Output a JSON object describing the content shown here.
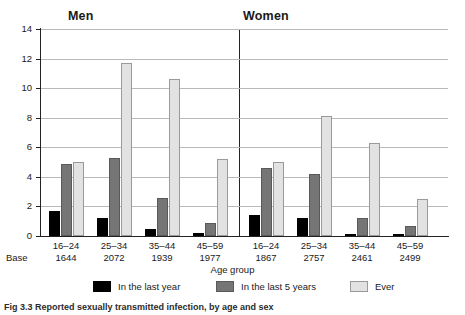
{
  "figure": {
    "caption": "Fig 3.3  Reported sexually transmitted infection, by age and sex"
  },
  "panels": [
    {
      "title": "Men"
    },
    {
      "title": "Women"
    }
  ],
  "axes": {
    "ylabel": "Percentage",
    "xlabel": "Age group",
    "base_word": "Base",
    "yticks": [
      "0",
      "2",
      "4",
      "6",
      "8",
      "10",
      "12",
      "14"
    ]
  },
  "legend": [
    {
      "key": "year",
      "label": "In the last year",
      "color": "#000000"
    },
    {
      "key": "five",
      "label": "In the last 5 years",
      "color": "#757575"
    },
    {
      "key": "ever",
      "label": "Ever",
      "color": "#e2e2e2"
    }
  ],
  "chart_data": {
    "type": "bar",
    "title": "Reported sexually transmitted infection, by age and sex",
    "xlabel": "Age group",
    "ylabel": "Percentage",
    "ylim": [
      0,
      14
    ],
    "ytick_step": 2,
    "grid": true,
    "legend_position": "bottom",
    "panels": [
      {
        "name": "Men",
        "categories": [
          "16–24",
          "25–34",
          "35–44",
          "45–59"
        ],
        "bases": [
          "1644",
          "2072",
          "1939",
          "1977"
        ],
        "series": [
          {
            "name": "In the last year",
            "values": [
              1.7,
              1.2,
              0.5,
              0.2
            ]
          },
          {
            "name": "In the last 5 years",
            "values": [
              4.9,
              5.3,
              2.6,
              0.9
            ]
          },
          {
            "name": "Ever",
            "values": [
              5.0,
              11.7,
              10.6,
              5.2
            ]
          }
        ]
      },
      {
        "name": "Women",
        "categories": [
          "16–24",
          "25–34",
          "35–44",
          "45–59"
        ],
        "bases": [
          "1867",
          "2757",
          "2461",
          "2499"
        ],
        "series": [
          {
            "name": "In the last year",
            "values": [
              1.4,
              1.2,
              0.15,
              0.1
            ]
          },
          {
            "name": "In the last 5 years",
            "values": [
              4.6,
              4.2,
              1.2,
              0.7
            ]
          },
          {
            "name": "Ever",
            "values": [
              5.0,
              8.1,
              6.3,
              2.5
            ]
          }
        ]
      }
    ]
  }
}
